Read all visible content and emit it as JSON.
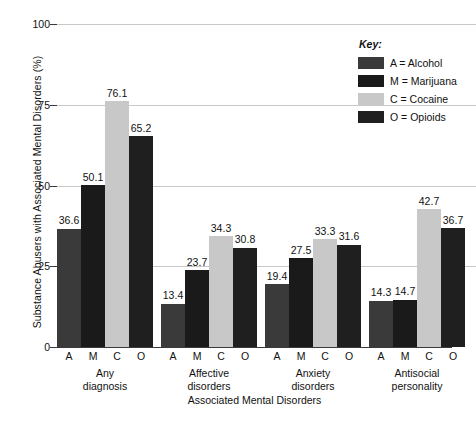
{
  "chart_data": {
    "type": "bar",
    "title": "",
    "xlabel": "Associated Mental Disorders",
    "ylabel": "Substance Abusers with Associated Mental Disorders (%)",
    "ylim": [
      0,
      100
    ],
    "yticks": [
      "0",
      "25",
      "50",
      "75",
      "100"
    ],
    "grid": true,
    "legend_position": "top-right",
    "legend_title": "Key:",
    "categories": [
      "Any\ndiagnosis",
      "Affective\ndisorders",
      "Anxiety\ndisorders",
      "Antisocial\npersonality"
    ],
    "subcategory_letters": [
      "A",
      "M",
      "C",
      "O"
    ],
    "series": [
      {
        "name": "A = Alcohol",
        "letter": "A",
        "color": "#3a3a3a",
        "values": [
          36.6,
          13.4,
          19.4,
          14.3
        ]
      },
      {
        "name": "M = Marijuana",
        "letter": "M",
        "color": "#1a1a1a",
        "values": [
          50.1,
          23.7,
          27.5,
          14.7
        ]
      },
      {
        "name": "C = Cocaine",
        "letter": "C",
        "color": "#c8c8c8",
        "values": [
          76.1,
          34.3,
          33.3,
          42.7
        ]
      },
      {
        "name": "O = Opioids",
        "letter": "O",
        "color": "#1f1f1f",
        "values": [
          65.2,
          30.8,
          31.6,
          36.7
        ]
      }
    ],
    "colors": {
      "gridline": "#c9c9c9",
      "axis": "#3a3a3a",
      "text": "#111111",
      "background": "#ffffff"
    }
  }
}
